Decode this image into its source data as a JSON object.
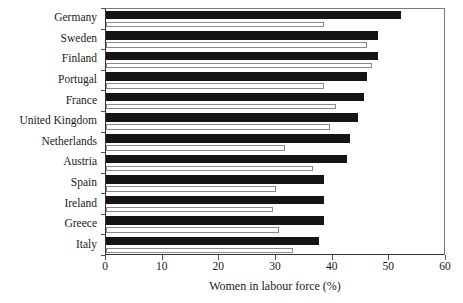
{
  "chart_data": {
    "type": "bar",
    "orientation": "horizontal",
    "title": "",
    "xlabel": "Women in labour force (%)",
    "ylabel": "",
    "xlim": [
      0,
      60
    ],
    "xticks": [
      0,
      10,
      20,
      30,
      40,
      50,
      60
    ],
    "grid": false,
    "legend": "none",
    "categories": [
      "Germany",
      "Sweden",
      "Finland",
      "Portugal",
      "France",
      "United Kingdom",
      "Netherlands",
      "Austria",
      "Spain",
      "Ireland",
      "Greece",
      "Italy"
    ],
    "series": [
      {
        "name": "solid-bar",
        "style": "filled-black",
        "color": "#151515",
        "values": [
          52.0,
          48.0,
          48.0,
          46.0,
          45.5,
          44.5,
          43.0,
          42.5,
          38.5,
          38.5,
          38.5,
          37.5
        ]
      },
      {
        "name": "hollow-bar",
        "style": "outlined-white",
        "color": "#ffffff",
        "edgecolor": "#8a8a8a",
        "values": [
          38.5,
          46.0,
          47.0,
          38.5,
          40.5,
          39.5,
          31.5,
          36.5,
          30.0,
          29.5,
          30.5,
          33.0
        ]
      }
    ]
  },
  "axis": {
    "x_title": "Women in labour force (%)",
    "tick_labels": [
      "0",
      "10",
      "20",
      "30",
      "40",
      "50",
      "60"
    ]
  },
  "colors": {
    "solid_bar": "#151515",
    "hollow_bar_fill": "#ffffff",
    "hollow_bar_edge": "#8a8a8a",
    "frame": "#333333",
    "text": "#1a1a1a",
    "background": "#ffffff"
  }
}
